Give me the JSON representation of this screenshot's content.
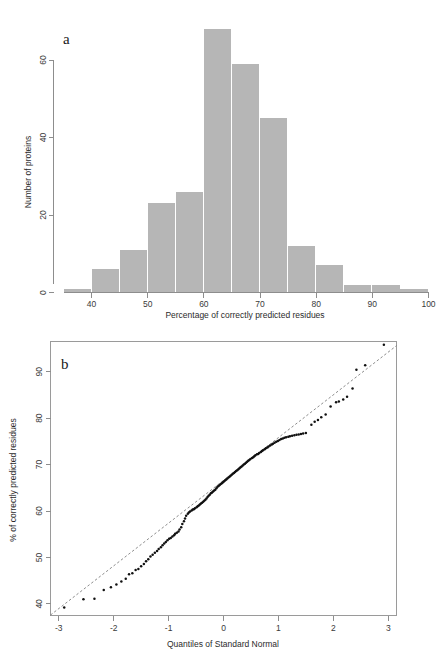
{
  "figure": {
    "panels": [
      {
        "letter": "a",
        "type": "histogram"
      },
      {
        "letter": "b",
        "type": "qq"
      }
    ]
  },
  "chart_data": [
    {
      "type": "bar",
      "panel_letter": "a",
      "title": "",
      "xlabel": "Percentage of correctly predicted residues",
      "ylabel": "Number of proteins",
      "xlim": [
        35,
        100
      ],
      "ylim": [
        0,
        70
      ],
      "xticks": [
        40,
        50,
        60,
        70,
        80,
        90,
        100
      ],
      "yticks": [
        0,
        20,
        40,
        60
      ],
      "grid": false,
      "legend": "none",
      "bin_width": 5,
      "bin_starts": [
        35,
        40,
        45,
        50,
        55,
        60,
        65,
        70,
        75,
        80,
        85,
        90,
        95
      ],
      "categories": [
        "35-40",
        "40-45",
        "45-50",
        "50-55",
        "55-60",
        "60-65",
        "65-70",
        "70-75",
        "75-80",
        "80-85",
        "85-90",
        "90-95",
        "95-100"
      ],
      "values": [
        1,
        6,
        11,
        23,
        26,
        68,
        59,
        45,
        12,
        7,
        2,
        2,
        1
      ],
      "bar_color": "#b6b6b6"
    },
    {
      "type": "scatter",
      "panel_letter": "b",
      "title": "",
      "xlabel": "Quantiles of Standard Normal",
      "ylabel": "% of correctly predicted residues",
      "xlim": [
        -3.15,
        3.15
      ],
      "ylim": [
        37.5,
        96.5
      ],
      "xticks": [
        -3,
        -2,
        -1,
        0,
        1,
        2,
        3
      ],
      "yticks": [
        40,
        50,
        60,
        70,
        80,
        90
      ],
      "grid": false,
      "legend": "none",
      "point_color": "#111111",
      "refline": {
        "style": "dashed",
        "color": "#6f6f6f",
        "x": [
          -3.15,
          3.15
        ],
        "y": [
          37.6,
          95.6
        ]
      },
      "points": [
        [
          -2.9,
          39.2
        ],
        [
          -2.55,
          41.0
        ],
        [
          -2.35,
          41.1
        ],
        [
          -2.18,
          43.0
        ],
        [
          -2.05,
          43.6
        ],
        [
          -1.95,
          44.2
        ],
        [
          -1.86,
          44.8
        ],
        [
          -1.78,
          45.4
        ],
        [
          -1.72,
          46.4
        ],
        [
          -1.66,
          46.6
        ],
        [
          -1.6,
          47.3
        ],
        [
          -1.55,
          47.5
        ],
        [
          -1.5,
          48.1
        ],
        [
          -1.45,
          48.6
        ],
        [
          -1.41,
          49.2
        ],
        [
          -1.37,
          49.6
        ],
        [
          -1.33,
          50.2
        ],
        [
          -1.29,
          50.6
        ],
        [
          -1.25,
          51.0
        ],
        [
          -1.21,
          51.4
        ],
        [
          -1.18,
          51.8
        ],
        [
          -1.14,
          52.2
        ],
        [
          -1.11,
          52.6
        ],
        [
          -1.08,
          53.0
        ],
        [
          -1.05,
          53.3
        ],
        [
          -1.02,
          53.7
        ],
        [
          -0.99,
          54.0
        ],
        [
          -0.96,
          54.2
        ],
        [
          -0.93,
          54.5
        ],
        [
          -0.9,
          54.8
        ],
        [
          -0.88,
          55.1
        ],
        [
          -0.85,
          55.3
        ],
        [
          -0.82,
          55.6
        ],
        [
          -0.8,
          56.0
        ],
        [
          -0.77,
          56.5
        ],
        [
          -0.75,
          57.2
        ],
        [
          -0.72,
          57.8
        ],
        [
          -0.7,
          58.4
        ],
        [
          -0.68,
          59.0
        ],
        [
          -0.65,
          59.4
        ],
        [
          -0.63,
          59.7
        ],
        [
          -0.61,
          59.9
        ],
        [
          -0.58,
          60.1
        ],
        [
          -0.56,
          60.3
        ],
        [
          -0.54,
          60.4
        ],
        [
          -0.52,
          60.6
        ],
        [
          -0.49,
          60.8
        ],
        [
          -0.47,
          61.0
        ],
        [
          -0.45,
          61.2
        ],
        [
          -0.43,
          61.4
        ],
        [
          -0.41,
          61.6
        ],
        [
          -0.39,
          61.8
        ],
        [
          -0.37,
          62.0
        ],
        [
          -0.35,
          62.2
        ],
        [
          -0.33,
          62.4
        ],
        [
          -0.31,
          62.7
        ],
        [
          -0.29,
          63.0
        ],
        [
          -0.27,
          63.3
        ],
        [
          -0.25,
          63.5
        ],
        [
          -0.23,
          63.8
        ],
        [
          -0.21,
          64.0
        ],
        [
          -0.19,
          64.2
        ],
        [
          -0.17,
          64.4
        ],
        [
          -0.15,
          64.6
        ],
        [
          -0.13,
          64.9
        ],
        [
          -0.11,
          65.2
        ],
        [
          -0.09,
          65.4
        ],
        [
          -0.07,
          65.6
        ],
        [
          -0.05,
          65.8
        ],
        [
          -0.03,
          66.0
        ],
        [
          -0.01,
          66.2
        ],
        [
          0.01,
          66.4
        ],
        [
          0.03,
          66.6
        ],
        [
          0.05,
          66.8
        ],
        [
          0.07,
          67.0
        ],
        [
          0.09,
          67.2
        ],
        [
          0.11,
          67.4
        ],
        [
          0.13,
          67.6
        ],
        [
          0.15,
          67.8
        ],
        [
          0.17,
          68.0
        ],
        [
          0.19,
          68.2
        ],
        [
          0.21,
          68.4
        ],
        [
          0.23,
          68.6
        ],
        [
          0.25,
          68.8
        ],
        [
          0.27,
          69.0
        ],
        [
          0.29,
          69.2
        ],
        [
          0.31,
          69.4
        ],
        [
          0.33,
          69.6
        ],
        [
          0.35,
          69.8
        ],
        [
          0.37,
          70.0
        ],
        [
          0.39,
          70.2
        ],
        [
          0.41,
          70.4
        ],
        [
          0.43,
          70.6
        ],
        [
          0.45,
          70.8
        ],
        [
          0.47,
          71.0
        ],
        [
          0.49,
          71.2
        ],
        [
          0.52,
          71.4
        ],
        [
          0.54,
          71.6
        ],
        [
          0.56,
          71.8
        ],
        [
          0.58,
          72.0
        ],
        [
          0.61,
          72.2
        ],
        [
          0.63,
          72.3
        ],
        [
          0.65,
          72.5
        ],
        [
          0.68,
          72.7
        ],
        [
          0.7,
          72.9
        ],
        [
          0.72,
          73.1
        ],
        [
          0.75,
          73.3
        ],
        [
          0.77,
          73.5
        ],
        [
          0.8,
          73.7
        ],
        [
          0.82,
          73.9
        ],
        [
          0.85,
          74.1
        ],
        [
          0.88,
          74.3
        ],
        [
          0.9,
          74.5
        ],
        [
          0.93,
          74.7
        ],
        [
          0.96,
          74.9
        ],
        [
          0.99,
          75.1
        ],
        [
          1.02,
          75.3
        ],
        [
          1.05,
          75.5
        ],
        [
          1.08,
          75.6
        ],
        [
          1.11,
          75.8
        ],
        [
          1.14,
          75.9
        ],
        [
          1.18,
          76.0
        ],
        [
          1.21,
          76.1
        ],
        [
          1.25,
          76.2
        ],
        [
          1.29,
          76.3
        ],
        [
          1.33,
          76.4
        ],
        [
          1.37,
          76.5
        ],
        [
          1.41,
          76.6
        ],
        [
          1.45,
          76.7
        ],
        [
          1.5,
          76.8
        ],
        [
          1.6,
          78.6
        ],
        [
          1.66,
          79.2
        ],
        [
          1.72,
          79.6
        ],
        [
          1.78,
          80.2
        ],
        [
          1.86,
          80.8
        ],
        [
          1.95,
          82.5
        ],
        [
          2.05,
          83.4
        ],
        [
          2.1,
          83.6
        ],
        [
          2.18,
          84.0
        ],
        [
          2.25,
          84.6
        ],
        [
          2.35,
          86.4
        ],
        [
          2.42,
          90.4
        ],
        [
          2.58,
          91.4
        ],
        [
          2.92,
          95.8
        ]
      ]
    }
  ]
}
